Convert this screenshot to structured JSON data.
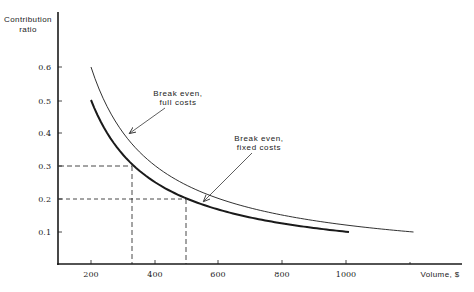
{
  "chart_data": {
    "type": "line",
    "title": "",
    "xlabel": "Volume, $",
    "ylabel": "Contribution ratio",
    "ylabel_lines": [
      "Contribution",
      "ratio"
    ],
    "xlim": [
      100,
      1400
    ],
    "ylim": [
      0,
      0.7
    ],
    "grid": false,
    "legend": "none (curves labeled by annotations)",
    "x_ticks": [
      200,
      400,
      600,
      800,
      1000
    ],
    "x_tick_labels": [
      "200",
      "400",
      "600",
      "800",
      "1000"
    ],
    "y_ticks": [
      0.1,
      0.2,
      0.3,
      0.4,
      0.5,
      0.6
    ],
    "y_tick_labels": [
      "0.1",
      "0.2",
      "0.3",
      "0.4",
      "0.5",
      "0.6"
    ],
    "series": [
      {
        "name": "Break even, full costs",
        "style": "thin",
        "x": [
          200,
          250,
          300,
          350,
          400,
          500,
          600,
          700,
          800,
          900,
          1000,
          1100,
          1200
        ],
        "y": [
          0.6,
          0.48,
          0.4,
          0.343,
          0.3,
          0.24,
          0.2,
          0.171,
          0.15,
          0.133,
          0.12,
          0.109,
          0.1
        ]
      },
      {
        "name": "Break even, fixed costs",
        "style": "thick",
        "x": [
          200,
          250,
          300,
          330,
          400,
          500,
          600,
          700,
          800,
          900,
          1000
        ],
        "y": [
          0.5,
          0.4,
          0.333,
          0.3,
          0.25,
          0.2,
          0.167,
          0.143,
          0.125,
          0.111,
          0.1
        ]
      }
    ],
    "reference_lines": [
      {
        "type": "dashed",
        "from": [
          100,
          0.3
        ],
        "to": [
          330,
          0.3
        ]
      },
      {
        "type": "dashed",
        "from": [
          330,
          0
        ],
        "to": [
          330,
          0.3
        ]
      },
      {
        "type": "dashed",
        "from": [
          100,
          0.2
        ],
        "to": [
          500,
          0.2
        ]
      },
      {
        "type": "dashed",
        "from": [
          500,
          0
        ],
        "to": [
          500,
          0.2
        ]
      }
    ],
    "annotations": [
      {
        "text_lines": [
          "Break even,",
          "full costs"
        ],
        "points_to_series": "Break even, full costs"
      },
      {
        "text_lines": [
          "Break even,",
          "fixed costs"
        ],
        "points_to_series": "Break even, fixed costs"
      }
    ]
  },
  "colors": {
    "ink": "#1a1a1a",
    "background": "#ffffff"
  }
}
